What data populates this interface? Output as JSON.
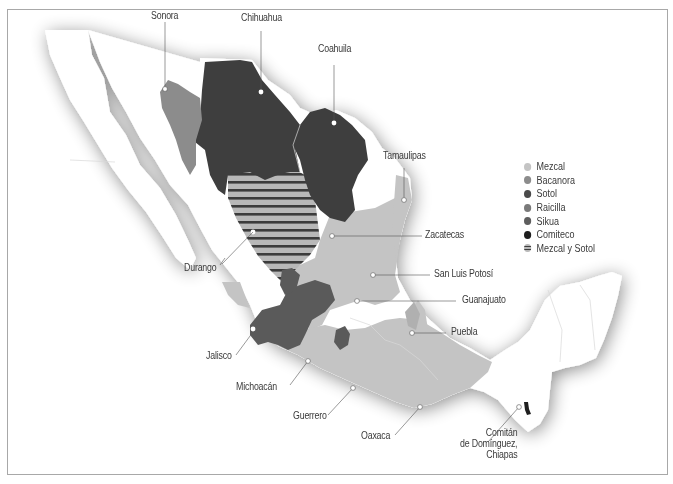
{
  "legend": {
    "items": [
      {
        "label": "Mezcal",
        "color": "#c4c4c4"
      },
      {
        "label": "Bacanora",
        "color": "#8c8c8c"
      },
      {
        "label": "Sotol",
        "color": "#4a4a4a"
      },
      {
        "label": "Raicilla",
        "color": "#7a7a7a"
      },
      {
        "label": "Sikua",
        "color": "#5e5e5e"
      },
      {
        "label": "Comiteco",
        "color": "#1e1e1e"
      },
      {
        "label": "Mezcal y Sotol",
        "color": "striped"
      }
    ]
  },
  "labels": {
    "sonora": "Sonora",
    "chihuahua": "Chihuahua",
    "coahuila": "Coahuila",
    "tamaulipas": "Tamaulipas",
    "zacatecas": "Zacatecas",
    "san_luis_potosi": "San Luis Potosí",
    "guanajuato": "Guanajuato",
    "puebla": "Puebla",
    "durango": "Durango",
    "jalisco": "Jalisco",
    "michoacan": "Michoacán",
    "guerrero": "Guerrero",
    "oaxaca": "Oaxaca",
    "comitan_1": "Comitán",
    "comitan_2": "de Domínguez,",
    "comitan_3": "Chiapas"
  },
  "colors": {
    "mezcal": "#c4c4c4",
    "bacanora": "#8c8c8c",
    "sotol": "#3e3e3e",
    "raicilla": "#7a7a7a",
    "sikua": "#5a5a5a",
    "comiteco": "#1e1e1e",
    "land": "#ffffff",
    "frame": "#a8a8a8"
  }
}
